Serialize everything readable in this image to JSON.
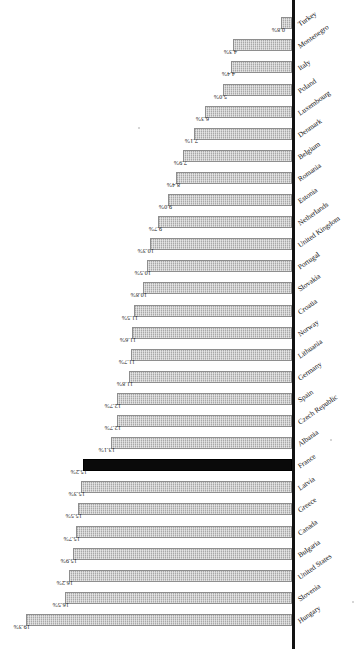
{
  "chart_data": {
    "type": "bar",
    "title": "",
    "subtitle": "",
    "xlabel": "",
    "ylabel": "",
    "orientation": "vertical-rotated",
    "grid": false,
    "legend": "none",
    "ylim": [
      0,
      19.3
    ],
    "value_suffix": "%",
    "highlight_category": "France",
    "highlight_color": "#0a0a0a",
    "bar_color": "#a8a8a8",
    "categories": [
      "Hungary",
      "Slovenia",
      "United States",
      "Bulgaria",
      "Canada",
      "Greece",
      "Latvia",
      "France",
      "Albania",
      "Czech Republic",
      "Spain",
      "Germany",
      "Lithuania",
      "Norway",
      "Croatia",
      "Slovakia",
      "Portugal",
      "United Kingdom",
      "Netherlands",
      "Estonia",
      "Romania",
      "Belgium",
      "Denmark",
      "Luxembourg",
      "Poland",
      "Italy",
      "Montenegro",
      "Turkey"
    ],
    "values": [
      19.3,
      16.5,
      16.2,
      15.9,
      15.7,
      15.5,
      15.3,
      15.2,
      13.1,
      12.7,
      12.7,
      11.8,
      11.7,
      11.6,
      11.5,
      10.8,
      10.5,
      10.3,
      9.7,
      9.0,
      8.4,
      7.9,
      7.1,
      6.3,
      5.0,
      4.4,
      4.3,
      0.8
    ],
    "value_labels": [
      "19.3%",
      "16.5%",
      "16.2%",
      "15.9%",
      "15.7%",
      "15.5%",
      "15.3%",
      "15.2%",
      "13.1%",
      "12.7%",
      "12.7%",
      "11.8%",
      "11.7%",
      "11.6%",
      "11.5%",
      "10.8%",
      "10.5%",
      "10.3%",
      "9.7%",
      "9.0%",
      "8.4%",
      "7.9%",
      "7.1%",
      "6.3%",
      "5.0%",
      "4.4%",
      "4.3%",
      "0.8%"
    ]
  }
}
